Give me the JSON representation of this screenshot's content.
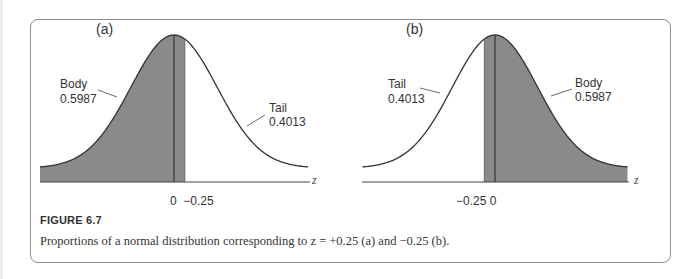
{
  "figure": {
    "title": "FIGURE 6.7",
    "caption": "Proportions of a normal distribution corresponding to z = +0.25 (a) and −0.25 (b)."
  },
  "panels": [
    {
      "label": "(a)",
      "left_annotation": {
        "name": "Body",
        "value": "0.5987"
      },
      "right_annotation": {
        "name": "Tail",
        "value": "0.4013"
      },
      "tick_labels": "0  −0.25",
      "axis_label": "z"
    },
    {
      "label": "(b)",
      "left_annotation": {
        "name": "Tail",
        "value": "0.4013"
      },
      "right_annotation": {
        "name": "Body",
        "value": "0.5987"
      },
      "tick_labels": "−0.25 0",
      "axis_label": "z"
    }
  ],
  "colors": {
    "shade": "#8a8a8a",
    "curve": "#333333",
    "frame": "#8c8c8c"
  },
  "chart_data": [
    {
      "type": "area",
      "title": "(a)",
      "xlabel": "z",
      "ylabel": "",
      "distribution": "standard normal",
      "z_cutoff": 0.25,
      "shaded_region": "z < 0.25",
      "tick_labels": [
        "0",
        "−0.25"
      ],
      "annotations": [
        {
          "label": "Body",
          "value": 0.5987,
          "region": "left of cutoff (shaded)"
        },
        {
          "label": "Tail",
          "value": 0.4013,
          "region": "right of cutoff (unshaded)"
        }
      ],
      "grid": false
    },
    {
      "type": "area",
      "title": "(b)",
      "xlabel": "z",
      "ylabel": "",
      "distribution": "standard normal",
      "z_cutoff": -0.25,
      "shaded_region": "z > -0.25",
      "tick_labels": [
        "−0.25",
        "0"
      ],
      "annotations": [
        {
          "label": "Tail",
          "value": 0.4013,
          "region": "left of cutoff (unshaded)"
        },
        {
          "label": "Body",
          "value": 0.5987,
          "region": "right of cutoff (shaded)"
        }
      ],
      "grid": false
    }
  ]
}
